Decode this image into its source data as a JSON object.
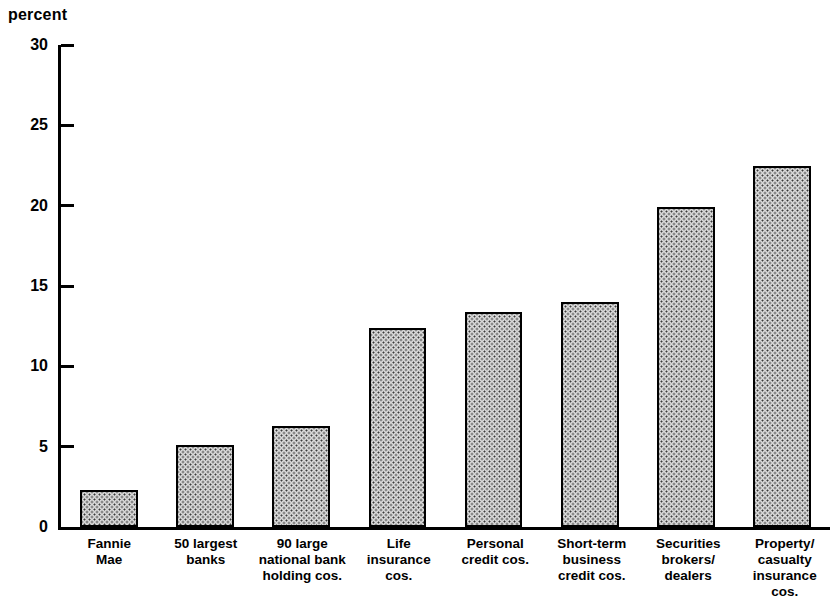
{
  "chart_data": {
    "type": "bar",
    "title": "",
    "subtitle": "",
    "xlabel": "",
    "ylabel": "percent",
    "ylim": [
      0,
      30
    ],
    "ytick_values": [
      30,
      25,
      20,
      15,
      10,
      5,
      0
    ],
    "ytick_labels": [
      "30",
      "25",
      "20",
      "15",
      "10",
      "5",
      "0"
    ],
    "grid": false,
    "legend": null,
    "annotations": [],
    "categories": [
      "Fannie\nMae",
      "50 largest\nbanks",
      "90 large\nnational bank\nholding cos.",
      "Life\ninsurance\ncos.",
      "Personal\ncredit cos.",
      "Short-term\nbusiness\ncredit cos.",
      "Securities\nbrokers/\ndealers",
      "Property/\ncasualty\ninsurance cos."
    ],
    "values": [
      2.3,
      5.1,
      6.3,
      12.4,
      13.4,
      14.0,
      19.9,
      22.5
    ],
    "bar_style": {
      "fill": "#d8d8d8",
      "pattern": "stipple-dots",
      "border": "#000000",
      "border_width_px": 2
    }
  }
}
